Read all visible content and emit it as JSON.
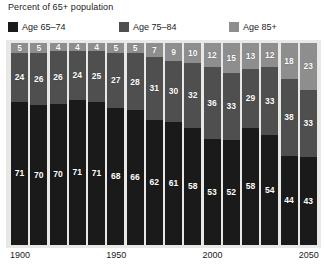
{
  "chart_data": {
    "type": "bar",
    "title": "Percent of 65+ population",
    "subtitle": "",
    "xlabel": "",
    "ylabel": "",
    "ylim": [
      0,
      100
    ],
    "stacked": true,
    "stack_mode": "percent",
    "grid": false,
    "legend_position": "top",
    "categories": [
      "1900",
      "1910",
      "1920",
      "1930",
      "1940",
      "1950",
      "1960",
      "1970",
      "1980",
      "1990",
      "2000",
      "2010",
      "2020",
      "2030",
      "2040",
      "2050"
    ],
    "tick_labels": [
      "1900",
      "1950",
      "2000",
      "2050"
    ],
    "tick_positions": [
      0,
      5,
      10,
      15
    ],
    "series": [
      {
        "name": "Age 65–74",
        "color": "#1a1a1a",
        "values": [
          71,
          70,
          70,
          71,
          71,
          68,
          66,
          62,
          61,
          58,
          53,
          52,
          58,
          54,
          44,
          43
        ]
      },
      {
        "name": "Age 75–84",
        "color": "#4f4f4f",
        "values": [
          24,
          26,
          26,
          24,
          25,
          27,
          28,
          31,
          30,
          32,
          36,
          33,
          29,
          33,
          38,
          33
        ]
      },
      {
        "name": "Age 85+",
        "color": "#8e8e8e",
        "values": [
          5,
          5,
          4,
          4,
          4,
          5,
          5,
          7,
          9,
          10,
          12,
          15,
          13,
          12,
          18,
          23
        ]
      }
    ]
  },
  "colors": {
    "panel_background": "#e8e8e6",
    "page_background": "#ffffff",
    "text": "#1b1b1b",
    "label_text": "#ffffff",
    "age_65_74": "#1a1a1a",
    "age_75_84": "#4f4f4f",
    "age_85_plus": "#8e8e8e"
  }
}
